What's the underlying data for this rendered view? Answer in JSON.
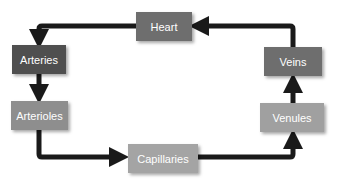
{
  "diagram": {
    "nodes": [
      {
        "id": "heart",
        "label": "Heart",
        "color": "#6e6e6e"
      },
      {
        "id": "arteries",
        "label": "Arteries",
        "color": "#4f4f4f"
      },
      {
        "id": "arterioles",
        "label": "Arterioles",
        "color": "#8e8e8e"
      },
      {
        "id": "capillaries",
        "label": "Capillaries",
        "color": "#a4a4a4"
      },
      {
        "id": "venules",
        "label": "Venules",
        "color": "#a0a0a0"
      },
      {
        "id": "veins",
        "label": "Veins",
        "color": "#6e6e6e"
      }
    ],
    "edges": [
      {
        "from": "heart",
        "to": "arteries"
      },
      {
        "from": "arteries",
        "to": "arterioles"
      },
      {
        "from": "arterioles",
        "to": "capillaries"
      },
      {
        "from": "capillaries",
        "to": "venules"
      },
      {
        "from": "venules",
        "to": "veins"
      },
      {
        "from": "veins",
        "to": "heart"
      }
    ],
    "arrow_color": "#1a1a1a"
  }
}
